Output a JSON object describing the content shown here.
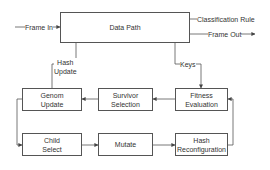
{
  "diagram": {
    "nodes": {
      "data_path": "Data Path",
      "genom_update": [
        "Genom",
        "Update"
      ],
      "survivor_selection": [
        "Survivor",
        "Selection"
      ],
      "fitness_evaluation": [
        "Fitness",
        "Evaluation"
      ],
      "child_select": [
        "Child",
        "Select"
      ],
      "mutate": "Mutate",
      "hash_reconfiguration": [
        "Hash",
        "Reconfiguration"
      ]
    },
    "edge_labels": {
      "frame_in": "Frame In",
      "classification_rule": "Classification Rule",
      "frame_out": "Frame Out",
      "hash_update": [
        "Hash",
        "Update"
      ],
      "keys": "Keys"
    },
    "colors": {
      "stroke": "#555555",
      "text": "#333333"
    }
  }
}
